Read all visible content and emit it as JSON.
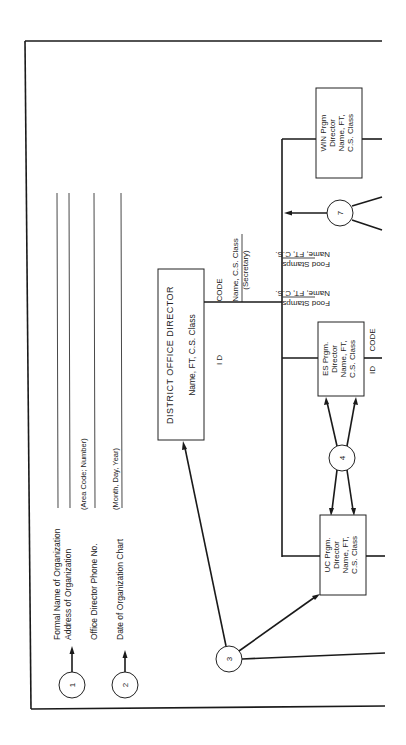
{
  "legend": {
    "items": [
      {
        "marker": "1",
        "lines": [
          "Formal Name of Organization",
          "Address of Organization"
        ]
      },
      {
        "marker": "",
        "lines": [
          "Office Director Phone No."
        ],
        "hint": "(Area Code; Number)"
      },
      {
        "marker": "2",
        "lines": [
          "Date of Organization Chart"
        ],
        "hint": "(Month,  Day,  Year)"
      }
    ]
  },
  "district_office": {
    "title": "DISTRICT OFFICE DIRECTOR",
    "subtitle": "Name,  FT,  C.S. Class",
    "id_label": "I D",
    "code_label": "CODE",
    "secretary_line1": "Name,  C.S. Class",
    "secretary_line2": "(Secretary)",
    "marker": "3"
  },
  "programs": [
    {
      "key": "uc",
      "lines": [
        "UC Prgm.",
        "Director",
        "Name,  FT,",
        "C.S.  Class"
      ]
    },
    {
      "key": "es",
      "lines": [
        "ES Prgm.",
        "Director",
        "Name,  FT,",
        "C.S.  Class"
      ],
      "id_label": "ID",
      "code_label": "CODE"
    },
    {
      "key": "win",
      "lines": [
        "WIN Prgm",
        "Director",
        "Name,  FT,",
        "C.S.  Class"
      ]
    }
  ],
  "food_stamps": [
    {
      "line1": "Name,  FT,  C.S.",
      "line2": "Food Stamps"
    },
    {
      "line1": "Name,  FT,  C.S.",
      "line2": "Food Stamps"
    }
  ],
  "markers": {
    "between_uc_es": "4",
    "food_stamps_group": "7"
  }
}
